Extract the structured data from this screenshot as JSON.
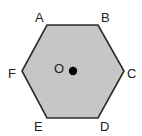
{
  "diagram": {
    "type": "regular-hexagon",
    "vertices": [
      {
        "id": "A",
        "label": "A"
      },
      {
        "id": "B",
        "label": "B"
      },
      {
        "id": "C",
        "label": "C"
      },
      {
        "id": "D",
        "label": "D"
      },
      {
        "id": "E",
        "label": "E"
      },
      {
        "id": "F",
        "label": "F"
      }
    ],
    "center": {
      "label": "O"
    },
    "colors": {
      "fill": "#c6c6c6",
      "stroke": "#2a2a2a",
      "center_dot": "#000000",
      "label": "#222222"
    }
  }
}
